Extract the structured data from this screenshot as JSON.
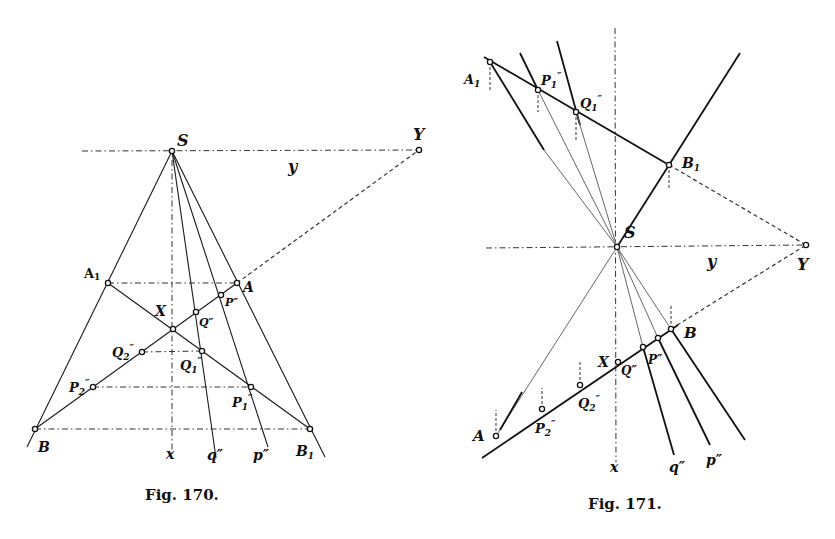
{
  "figures": [
    {
      "id": "fig170",
      "caption": "Fig. 170.",
      "labels": {
        "S": "S",
        "Y": "Y",
        "y": "y",
        "A1": "A",
        "A1_sub": "1",
        "A": "A",
        "X": "X",
        "P": "P″",
        "Q": "Q″",
        "Q2": "Q",
        "Q2_sub": "2",
        "Q2_sup": "″",
        "Q1": "Q",
        "Q1_sub": "1",
        "Q1_sup": "″",
        "P2": "P",
        "P2_sub": "2",
        "P2_sup": "″",
        "P1": "P",
        "P1_sub": "1",
        "P1_sup": "″",
        "B": "B",
        "B1": "B",
        "B1_sub": "1",
        "x": "x",
        "q_line": "q″",
        "p_line": "p″"
      }
    },
    {
      "id": "fig171",
      "caption": "Fig. 171.",
      "labels": {
        "S": "S",
        "Y": "Y",
        "y": "y",
        "A1": "A",
        "A1_sub": "1",
        "P1": "P",
        "P1_sub": "1",
        "P1_sup": "″",
        "Q1": "Q",
        "Q1_sub": "1",
        "Q1_sup": "″",
        "B1": "B",
        "B1_sub": "1",
        "B": "B",
        "X": "X",
        "Q": "Q″",
        "P": "P″",
        "Q2": "Q",
        "Q2_sub": "2",
        "Q2_sup": "″",
        "P2": "P",
        "P2_sub": "2",
        "P2_sup": "″",
        "A": "A",
        "x": "x",
        "q_line": "q″",
        "p_line": "p″"
      }
    }
  ]
}
